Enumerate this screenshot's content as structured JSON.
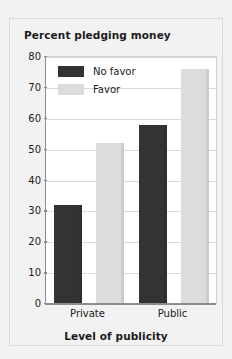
{
  "chart_data": {
    "type": "bar",
    "title": "Percent pledging money",
    "xlabel": "Level of publicity",
    "ylabel": "",
    "categories": [
      "Private",
      "Public"
    ],
    "series": [
      {
        "name": "No favor",
        "values": [
          32,
          58
        ],
        "color": "#333333"
      },
      {
        "name": "Favor",
        "values": [
          52,
          76
        ],
        "color": "#dcdcdc"
      }
    ],
    "ylim": [
      0,
      80
    ],
    "yticks": [
      0,
      10,
      20,
      30,
      40,
      50,
      60,
      70,
      80
    ],
    "ytick_labels": [
      "0",
      "10",
      "20",
      "30",
      "40",
      "50",
      "60",
      "70",
      "80"
    ],
    "grid": true,
    "legend_position": "upper-left-inside"
  },
  "legend": {
    "entries": [
      {
        "label": "No favor"
      },
      {
        "label": "Favor"
      }
    ]
  },
  "colors": {
    "no_favor": "#333333",
    "favor": "#dcdcdc",
    "background": "#f2f2f2",
    "plot_background": "#ffffff",
    "axis": "#8c8c8c",
    "gridline": "#d9d9d9",
    "text": "#1b1b1b"
  }
}
